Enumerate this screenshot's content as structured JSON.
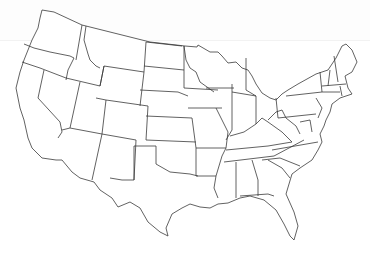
{
  "map": {
    "title": "United States blank outline map",
    "type": "states-outline",
    "region": "Contiguous United States",
    "stroke_color": "#3a3a3a",
    "background_color": "#ffffff"
  }
}
